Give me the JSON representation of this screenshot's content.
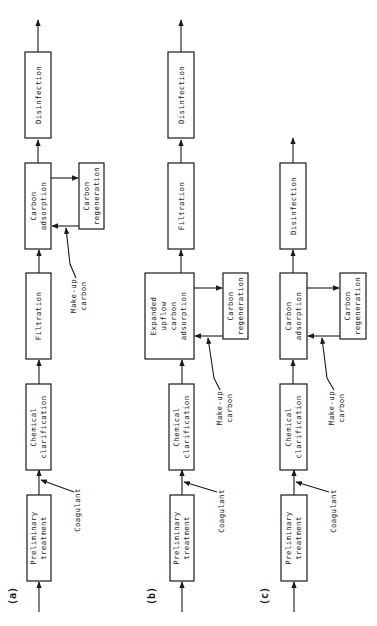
{
  "figure": {
    "panels": [
      {
        "id": "a",
        "label": "(a)",
        "process_steps": [
          "Preliminary treatment",
          "Chemical clarification",
          "Filtration",
          "Carbon adsorption",
          "Disinfection"
        ],
        "boxes": {
          "preliminary": [
            "Preliminary",
            "treatment"
          ],
          "clarification": [
            "Chemical",
            "clarification"
          ],
          "filtration": [
            "Filtration"
          ],
          "adsorption": [
            "Carbon",
            "adsorption"
          ],
          "regeneration": [
            "Carbon",
            "regeneration"
          ],
          "disinfection": [
            "Disinfection"
          ]
        },
        "inputs": {
          "coagulant": "Coagulant",
          "makeup": [
            "Make-up",
            "carbon"
          ]
        }
      },
      {
        "id": "b",
        "label": "(b)",
        "process_steps": [
          "Preliminary treatment",
          "Chemical clarification",
          "Expanded upflow carbon adsorption",
          "Filtration",
          "Disinfection"
        ],
        "boxes": {
          "preliminary": [
            "Preliminary",
            "treatment"
          ],
          "clarification": [
            "Chemical",
            "clarification"
          ],
          "adsorption": [
            "Expanded",
            "upflow",
            "carbon",
            "adsorption"
          ],
          "regeneration": [
            "Carbon",
            "regeneration"
          ],
          "filtration": [
            "Filtration"
          ],
          "disinfection": [
            "Disinfection"
          ]
        },
        "inputs": {
          "coagulant": "Coagulant",
          "makeup": [
            "Make-up",
            "carbon"
          ]
        }
      },
      {
        "id": "c",
        "label": "(c)",
        "process_steps": [
          "Preliminary treatment",
          "Chemical clarification",
          "Carbon adsorption",
          "Disinfection"
        ],
        "boxes": {
          "preliminary": [
            "Preliminary",
            "treatment"
          ],
          "clarification": [
            "Chemical",
            "clarification"
          ],
          "adsorption": [
            "Carbon",
            "adsorption"
          ],
          "regeneration": [
            "Carbon",
            "regeneration"
          ],
          "disinfection": [
            "Disinfection"
          ]
        },
        "inputs": {
          "coagulant": "Coagulant",
          "makeup": [
            "Make-up",
            "carbon"
          ]
        }
      }
    ]
  }
}
